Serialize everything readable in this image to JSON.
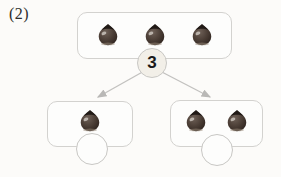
{
  "problem_number": "(2)",
  "diagram": {
    "total_circle": {
      "label": "3"
    },
    "top_box": {
      "item": "chestnut",
      "count": 3
    },
    "left_box": {
      "item": "chestnut",
      "count": 1,
      "answer_blank": ""
    },
    "right_box": {
      "item": "chestnut",
      "count": 2,
      "answer_blank": ""
    },
    "colors": {
      "box_border": "#d3d2cf",
      "arrow": "#c2c1bf",
      "total_circle_fill": "#f2efe8",
      "circle_border": "#c8c7c4",
      "chestnut_body": "#4a3d35",
      "chestnut_cap": "#211a16",
      "text": "#1a1a1a"
    }
  }
}
